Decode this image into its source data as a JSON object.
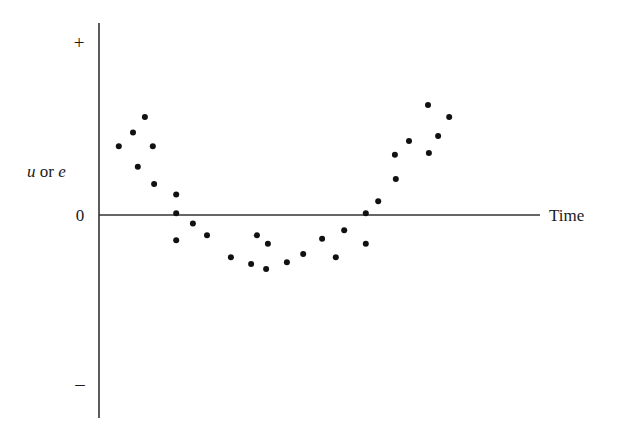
{
  "chart_data": {
    "type": "scatter",
    "title": "",
    "xlabel": "Time",
    "ylabel": {
      "var1": "u",
      "connector": " or ",
      "var2": "e"
    },
    "ytick_labels": {
      "plus": "+",
      "zero": "0",
      "minus": "–"
    },
    "xlim": [
      0,
      1
    ],
    "ylim": [
      -1,
      1
    ],
    "grid": false,
    "legend": "none",
    "marker_color": "#111111",
    "axis_color": "#333333",
    "points": [
      {
        "x": 0.045,
        "y": 0.4
      },
      {
        "x": 0.077,
        "y": 0.48
      },
      {
        "x": 0.104,
        "y": 0.57
      },
      {
        "x": 0.122,
        "y": 0.4
      },
      {
        "x": 0.088,
        "y": 0.28
      },
      {
        "x": 0.125,
        "y": 0.18
      },
      {
        "x": 0.175,
        "y": 0.12
      },
      {
        "x": 0.175,
        "y": 0.01
      },
      {
        "x": 0.175,
        "y": -0.15
      },
      {
        "x": 0.213,
        "y": -0.05
      },
      {
        "x": 0.245,
        "y": -0.12
      },
      {
        "x": 0.299,
        "y": -0.25
      },
      {
        "x": 0.345,
        "y": -0.29
      },
      {
        "x": 0.358,
        "y": -0.12
      },
      {
        "x": 0.383,
        "y": -0.17
      },
      {
        "x": 0.379,
        "y": -0.32
      },
      {
        "x": 0.426,
        "y": -0.28
      },
      {
        "x": 0.463,
        "y": -0.23
      },
      {
        "x": 0.506,
        "y": -0.14
      },
      {
        "x": 0.537,
        "y": -0.25
      },
      {
        "x": 0.556,
        "y": -0.09
      },
      {
        "x": 0.605,
        "y": 0.01
      },
      {
        "x": 0.605,
        "y": -0.17
      },
      {
        "x": 0.633,
        "y": 0.08
      },
      {
        "x": 0.673,
        "y": 0.21
      },
      {
        "x": 0.671,
        "y": 0.35
      },
      {
        "x": 0.703,
        "y": 0.43
      },
      {
        "x": 0.746,
        "y": 0.64
      },
      {
        "x": 0.748,
        "y": 0.36
      },
      {
        "x": 0.769,
        "y": 0.46
      },
      {
        "x": 0.794,
        "y": 0.57
      }
    ]
  }
}
